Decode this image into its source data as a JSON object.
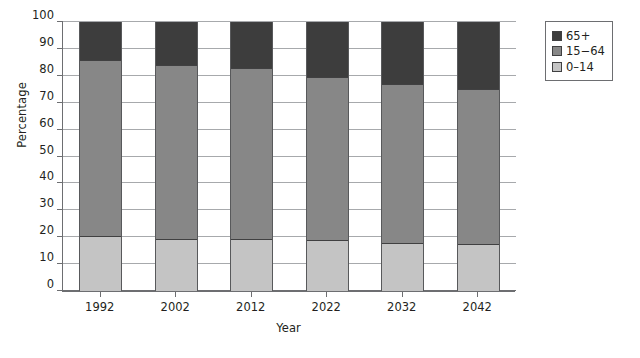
{
  "chart_data": {
    "type": "bar",
    "subtype": "stacked-bar-100",
    "title": "",
    "xlabel": "Year",
    "ylabel": "Percentage",
    "categories": [
      "1992",
      "2002",
      "2012",
      "2022",
      "2032",
      "2042"
    ],
    "ylim": [
      0,
      100
    ],
    "yticks": [
      0,
      10,
      20,
      30,
      40,
      50,
      60,
      70,
      80,
      90,
      100
    ],
    "grid": true,
    "legend_position": "top-right",
    "series": [
      {
        "name": "0–14",
        "color": "#c4c4c4",
        "values": [
          20.5,
          19.5,
          19.3,
          19.0,
          18.0,
          17.3
        ]
      },
      {
        "name": "15−64",
        "color": "#878787",
        "values": [
          65.5,
          64.5,
          63.7,
          60.5,
          59.0,
          57.7
        ]
      },
      {
        "name": "65+",
        "color": "#3d3d3d",
        "values": [
          14.0,
          16.0,
          17.0,
          20.5,
          23.0,
          25.0
        ]
      }
    ],
    "stack_tops": {
      "0–14": [
        20.5,
        19.5,
        19.3,
        19.0,
        18.0,
        17.3
      ],
      "15−64": [
        86.0,
        84.0,
        83.0,
        79.5,
        77.0,
        75.0
      ],
      "65+": [
        100,
        100,
        100,
        100,
        100,
        100
      ]
    }
  },
  "legend": {
    "items": [
      {
        "label": "65+",
        "color": "#3d3d3d"
      },
      {
        "label": "15−64",
        "color": "#878787"
      },
      {
        "label": "0–14",
        "color": "#c4c4c4"
      }
    ]
  },
  "axes": {
    "y_title": "Percentage",
    "x_title": "Year",
    "y_tick_labels": [
      "100",
      "90",
      "80",
      "70",
      "60",
      "50",
      "40",
      "30",
      "20",
      "10",
      "0"
    ],
    "x_tick_labels": [
      "1992",
      "2002",
      "2012",
      "2022",
      "2032",
      "2042"
    ]
  },
  "colors": {
    "axis": "#6d6e71",
    "grid": "#a7a9ac",
    "text": "#231f20",
    "background": "#ffffff",
    "series_65plus": "#3d3d3d",
    "series_15_64": "#878787",
    "series_0_14": "#c4c4c4"
  }
}
